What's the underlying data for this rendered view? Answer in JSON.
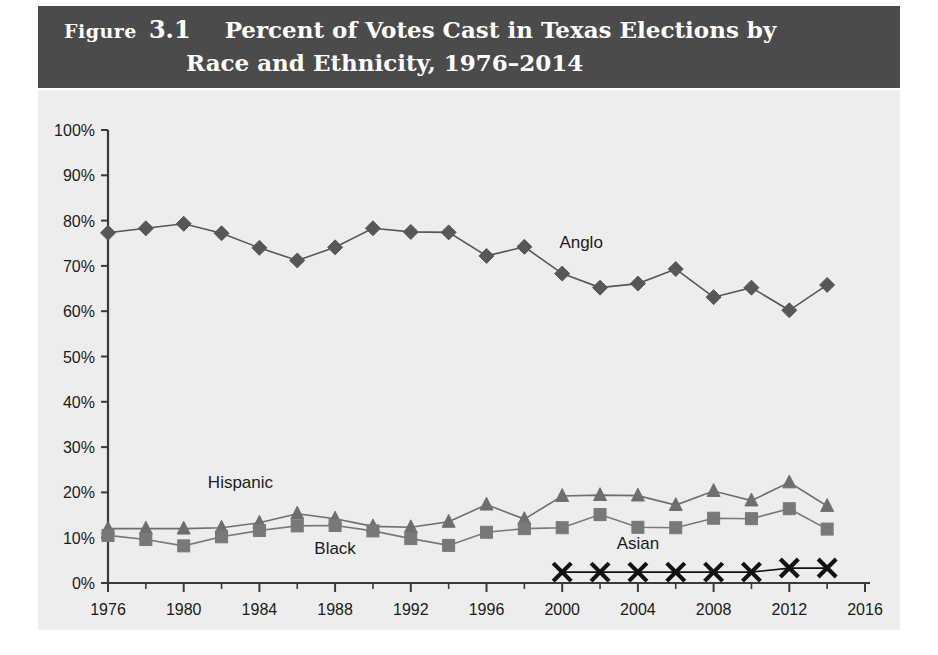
{
  "header": {
    "figure_word": "Figure",
    "figure_number": "3.1",
    "title_line_1": "Percent of Votes Cast in Texas Elections by",
    "title_line_2": "Race and Ethnicity, 1976–2014",
    "band_color": "#4b4b4b",
    "text_color": "#ffffff"
  },
  "chart_data": {
    "type": "line",
    "title": "Percent of Votes Cast in Texas Elections by Race and Ethnicity, 1976–2014",
    "xlabel": "",
    "ylabel": "",
    "xlim": [
      1976,
      2016
    ],
    "ylim": [
      0,
      100
    ],
    "grid": false,
    "legend": "inline-labels",
    "plot_background": "#ededed",
    "x_tick_labels": [
      "1976",
      "1980",
      "1984",
      "1988",
      "1992",
      "1996",
      "2000",
      "2004",
      "2008",
      "2012",
      "2016"
    ],
    "x_tick_values": [
      1976,
      1980,
      1984,
      1988,
      1992,
      1996,
      2000,
      2004,
      2008,
      2012,
      2016
    ],
    "x_minor_tick_values": [
      1978,
      1982,
      1986,
      1990,
      1994,
      1998,
      2002,
      2006,
      2010,
      2014
    ],
    "y_tick_labels": [
      "0%",
      "10%",
      "20%",
      "30%",
      "40%",
      "50%",
      "60%",
      "70%",
      "80%",
      "90%",
      "100%"
    ],
    "y_tick_values": [
      0,
      10,
      20,
      30,
      40,
      50,
      60,
      70,
      80,
      90,
      100
    ],
    "series": [
      {
        "name": "Anglo",
        "marker": "diamond",
        "color": "#575757",
        "label_x": 2001,
        "label_y": 74,
        "x": [
          1976,
          1978,
          1980,
          1982,
          1984,
          1986,
          1988,
          1990,
          1992,
          1994,
          1996,
          1998,
          2000,
          2002,
          2004,
          2006,
          2008,
          2010,
          2012,
          2014
        ],
        "values": [
          77.3,
          78.3,
          79.3,
          77.2,
          74.0,
          71.2,
          74.1,
          78.3,
          77.5,
          77.4,
          72.2,
          74.2,
          68.3,
          65.2,
          66.1,
          69.3,
          63.1,
          65.2,
          60.2,
          65.8
        ]
      },
      {
        "name": "Hispanic",
        "marker": "triangle",
        "color": "#6e6e6e",
        "label_x": 1983,
        "label_y": 21,
        "x": [
          1976,
          1978,
          1980,
          1982,
          1984,
          1986,
          1988,
          1990,
          1992,
          1994,
          1996,
          1998,
          2000,
          2002,
          2004,
          2006,
          2008,
          2010,
          2012,
          2014
        ],
        "values": [
          12.0,
          12.0,
          12.0,
          12.2,
          13.3,
          15.3,
          14.2,
          12.5,
          12.3,
          13.5,
          17.3,
          14.1,
          19.2,
          19.4,
          19.3,
          17.2,
          20.3,
          18.2,
          22.2,
          17.0
        ]
      },
      {
        "name": "Black",
        "marker": "square",
        "color": "#787878",
        "label_x": 1988,
        "label_y": 6.5,
        "x": [
          1976,
          1978,
          1980,
          1982,
          1984,
          1986,
          1988,
          1990,
          1992,
          1994,
          1996,
          1998,
          2000,
          2002,
          2004,
          2006,
          2008,
          2010,
          2012,
          2014
        ],
        "values": [
          10.5,
          9.6,
          8.2,
          10.2,
          11.6,
          12.6,
          12.7,
          11.5,
          9.8,
          8.3,
          11.2,
          12.0,
          12.2,
          15.1,
          12.3,
          12.2,
          14.3,
          14.2,
          16.4,
          11.9
        ]
      },
      {
        "name": "Asian",
        "marker": "x",
        "color": "#111111",
        "label_x": 2004,
        "label_y": 7.5,
        "x": [
          2000,
          2002,
          2004,
          2006,
          2008,
          2010,
          2012,
          2014
        ],
        "values": [
          2.4,
          2.4,
          2.4,
          2.4,
          2.4,
          2.4,
          3.3,
          3.3
        ]
      }
    ]
  }
}
